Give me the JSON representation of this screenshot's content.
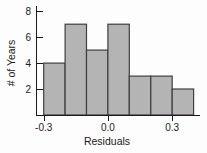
{
  "chart_data": {
    "type": "histogram",
    "title": "",
    "xlabel": "Residuals",
    "ylabel": "# of Years",
    "bin_edges": [
      -0.3,
      -0.2,
      -0.1,
      0.0,
      0.1,
      0.2,
      0.3,
      0.4
    ],
    "counts": [
      4,
      7,
      5,
      7,
      3,
      3,
      2
    ],
    "x_ticks": [
      -0.3,
      0.0,
      0.3
    ],
    "x_tick_labels": [
      "-0.3",
      "0.0",
      "0.3"
    ],
    "y_ticks": [
      2,
      4,
      6,
      8
    ],
    "y_tick_labels": [
      "2",
      "4",
      "6",
      "8"
    ],
    "xlim": [
      -0.336,
      0.43
    ],
    "ylim": [
      0,
      8.4
    ],
    "grid": false,
    "colors": {
      "bar_fill": "#b4b4b4",
      "bar_stroke": "#3f3f3f",
      "axis": "#1a1a1a",
      "text": "#1a1a1a",
      "background": "#fdfdfd"
    }
  }
}
